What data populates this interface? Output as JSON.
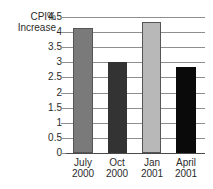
{
  "chart_data": {
    "type": "bar",
    "title": "",
    "subtitle": "",
    "xlabel": "",
    "ylabel": "CPI% Increase",
    "ylabel_lines": [
      "CPI%",
      "Increase"
    ],
    "categories": [
      "July 2000",
      "Oct 2000",
      "Jan 2001",
      "April 2001"
    ],
    "category_lines": [
      [
        "July",
        "2000"
      ],
      [
        "Oct",
        "2000"
      ],
      [
        "Jan",
        "2001"
      ],
      [
        "April",
        "2001"
      ]
    ],
    "values": [
      4.15,
      3.0,
      4.33,
      2.85
    ],
    "bar_colors": [
      "#7a7a7a",
      "#333333",
      "#b8b8b8",
      "#0a0a0a"
    ],
    "bar_border_color": "#555555",
    "ylim": [
      0,
      4.5
    ],
    "ytick_labels": [
      "4.5",
      "4",
      "3.5",
      "3",
      "2.5",
      "2",
      "1.5",
      "1",
      "0.5",
      "0"
    ],
    "ytick_values": [
      4.5,
      4,
      3.5,
      3,
      2.5,
      2,
      1.5,
      1,
      0.5,
      0
    ],
    "grid": true,
    "grid_color": "#8e8e8e",
    "axis_color": "#4a4a4a",
    "legend": [],
    "legend_position": "none",
    "annotations": [],
    "background": "#ffffff",
    "text_color": "#2b2b2b"
  }
}
